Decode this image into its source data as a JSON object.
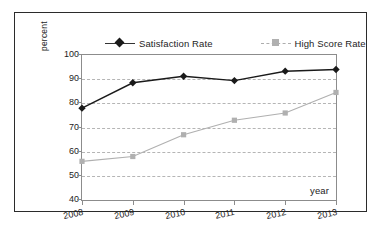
{
  "chart_data": {
    "type": "line",
    "title": "",
    "xlabel": "year",
    "ylabel": "percent",
    "categories": [
      "2008",
      "2009",
      "2010",
      "2011",
      "2012",
      "2013"
    ],
    "ylim": [
      40,
      100
    ],
    "yticks": [
      40,
      50,
      60,
      70,
      80,
      90,
      100
    ],
    "grid": "horizontal-dashed",
    "legend_position": "top",
    "series": [
      {
        "name": "Satisfaction Rate",
        "color": "#1a1a1a",
        "marker": "diamond",
        "linestyle": "solid",
        "values": [
          78,
          88.5,
          91.2,
          89.4,
          93.3,
          94
        ]
      },
      {
        "name": "High Score Rate",
        "color": "#b0b0b0",
        "marker": "square",
        "linestyle": "solid",
        "values": [
          56,
          58,
          67,
          73,
          76,
          84.5
        ]
      }
    ]
  },
  "legend": {
    "entries": [
      {
        "label": "Satisfaction Rate"
      },
      {
        "label": "High Score Rate"
      }
    ]
  },
  "axis": {
    "y_label": "percent",
    "x_label": "year",
    "y_ticks": [
      "100",
      "90",
      "80",
      "70",
      "60",
      "50",
      "40"
    ],
    "x_ticks": [
      "2008",
      "2009",
      "2010",
      "2011",
      "2012",
      "2013"
    ]
  }
}
